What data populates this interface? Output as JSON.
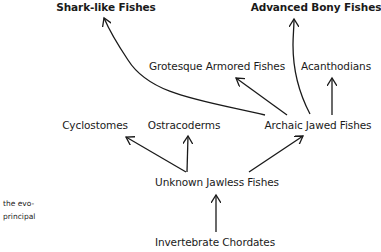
{
  "diagram": {
    "type": "evolutionary-tree",
    "nodes": [
      {
        "id": "shark",
        "label": "Shark-like Fishes",
        "bold": true
      },
      {
        "id": "bony",
        "label": "Advanced Bony Fishes",
        "bold": true
      },
      {
        "id": "armored",
        "label": "Grotesque Armored Fishes",
        "bold": false
      },
      {
        "id": "acanth",
        "label": "Acanthodians",
        "bold": false
      },
      {
        "id": "cyclo",
        "label": "Cyclostomes",
        "bold": false
      },
      {
        "id": "ostra",
        "label": "Ostracoderms",
        "bold": false
      },
      {
        "id": "archaic",
        "label": "Archaic Jawed Fishes",
        "bold": false
      },
      {
        "id": "jawless",
        "label": "Unknown Jawless Fishes",
        "bold": false
      },
      {
        "id": "invert",
        "label": "Invertebrate Chordates",
        "bold": false
      }
    ],
    "edges": [
      {
        "from": "invert",
        "to": "jawless"
      },
      {
        "from": "jawless",
        "to": "cyclo"
      },
      {
        "from": "jawless",
        "to": "ostra"
      },
      {
        "from": "jawless",
        "to": "archaic"
      },
      {
        "from": "archaic",
        "to": "shark"
      },
      {
        "from": "archaic",
        "to": "armored"
      },
      {
        "from": "archaic",
        "to": "bony"
      },
      {
        "from": "archaic",
        "to": "acanth"
      }
    ]
  },
  "side_text": {
    "line1": "the evo-",
    "line2": "principal"
  }
}
